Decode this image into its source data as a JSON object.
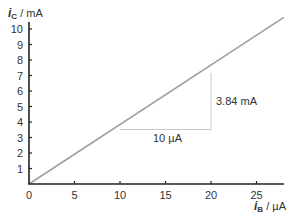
{
  "chart_data": {
    "type": "line",
    "title": "",
    "xlabel": "i_B / µA",
    "ylabel": "i_C / mA",
    "xlabel_symbol": "i",
    "xlabel_sub": "B",
    "xlabel_unit": " / µA",
    "ylabel_symbol": "i",
    "ylabel_sub": "C",
    "ylabel_unit": " / mA",
    "xlim": [
      0,
      28
    ],
    "ylim": [
      0,
      10.5
    ],
    "x_ticks": [
      "0",
      "5",
      "10",
      "15",
      "20",
      "25"
    ],
    "y_ticks": [
      "1",
      "2",
      "3",
      "4",
      "5",
      "6",
      "7",
      "8",
      "9",
      "10"
    ],
    "grid": false,
    "legend": null,
    "series": [
      {
        "name": "i_C vs i_B",
        "x": [
          0,
          28
        ],
        "y": [
          0,
          10.75
        ],
        "color": "#a0a0a0"
      }
    ],
    "annotations": [
      {
        "type": "slope-triangle",
        "from_x": 10,
        "to_x": 20,
        "dx_label": "10 µA",
        "dy_label": "3.84 mA"
      }
    ],
    "slope_mA_per_uA": 0.384
  }
}
